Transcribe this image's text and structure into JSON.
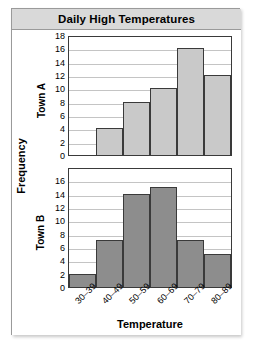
{
  "figure": {
    "title": "Daily High Temperatures",
    "background_color": "#ffffff",
    "title_bar_color": "#d9d9d9",
    "border_color": "#9a9a9a"
  },
  "axes": {
    "shared_ylabel": "Frequency",
    "xlabel": "Temperature"
  },
  "chart_data": [
    {
      "type": "bar",
      "title": "Daily High Temperatures",
      "panel_label": "Town A",
      "categories": [
        "30–39",
        "40–49",
        "50–59",
        "60–69",
        "70–79",
        "80–89"
      ],
      "values": [
        0,
        4,
        8,
        10,
        16,
        12
      ],
      "xlabel": "Temperature",
      "ylabel": "Frequency",
      "ylim": [
        0,
        18
      ],
      "ytick_step": 2,
      "yticks": [
        18,
        16,
        14,
        12,
        10,
        8,
        6,
        4,
        2,
        0
      ],
      "grid": true,
      "bar_color": "#c9c9c9",
      "bar_edge_color": "#3a3a3a",
      "legend": "none"
    },
    {
      "type": "bar",
      "title": "Daily High Temperatures",
      "panel_label": "Town B",
      "categories": [
        "30–39",
        "40–49",
        "50–59",
        "60–69",
        "70–79",
        "80–89"
      ],
      "values": [
        2,
        7,
        14,
        15,
        7,
        5
      ],
      "xlabel": "Temperature",
      "ylabel": "Frequency",
      "ylim": [
        0,
        18
      ],
      "ytick_step": 2,
      "yticks": [
        16,
        14,
        12,
        10,
        8,
        6,
        4,
        2,
        0
      ],
      "grid": true,
      "bar_color": "#8d8d8d",
      "bar_edge_color": "#3a3a3a",
      "legend": "none"
    }
  ]
}
